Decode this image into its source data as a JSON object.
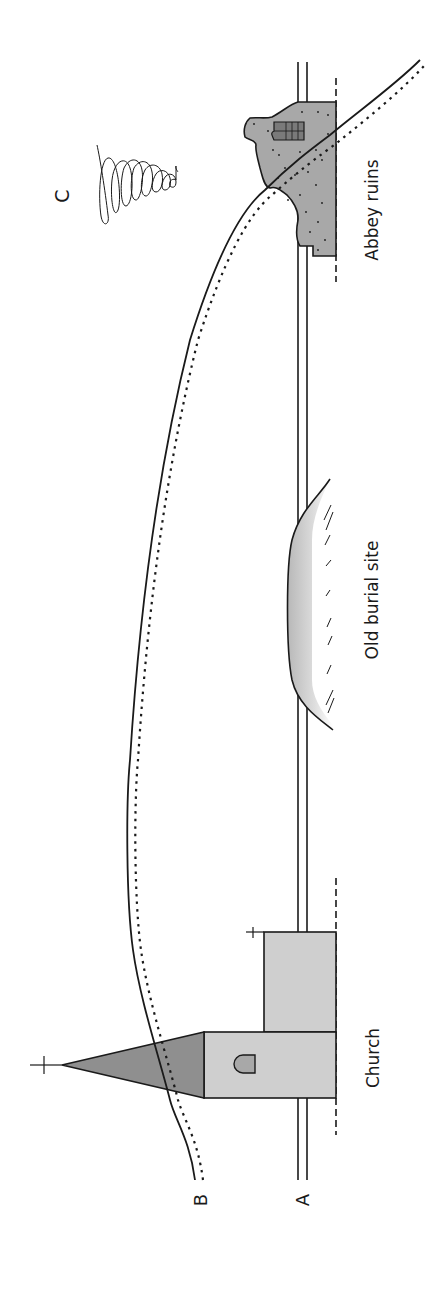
{
  "diagram": {
    "orientation": "rotated-90-ccw",
    "labels": {
      "line_a": "A",
      "line_b": "B",
      "point_c": "C",
      "church": "Church",
      "burial": "Old burial site",
      "abbey": "Abbey ruins"
    },
    "colors": {
      "line": "#1a1a1a",
      "church_fill": "#cfcfcf",
      "spire_fill": "#8f8f8f",
      "abbey_fill": "#a8a8a8",
      "mound_fill": "#d8d8d8",
      "background": "#ffffff"
    },
    "elements": [
      {
        "id": "line-a",
        "type": "double-line",
        "label": "A"
      },
      {
        "id": "line-b",
        "type": "curve-solid-and-dotted",
        "label": "B"
      },
      {
        "id": "spiral-c",
        "type": "spiral",
        "label": "C"
      },
      {
        "id": "church",
        "type": "building",
        "label": "Church"
      },
      {
        "id": "burial-mound",
        "type": "mound",
        "label": "Old burial site"
      },
      {
        "id": "abbey",
        "type": "ruin",
        "label": "Abbey ruins"
      }
    ]
  }
}
